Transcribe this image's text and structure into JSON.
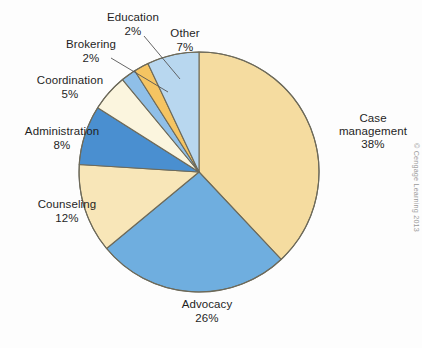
{
  "figure": {
    "background_color": "#fdfdfd",
    "credit": "© Cengage Learning 2013"
  },
  "chart_data": {
    "type": "pie",
    "title": "",
    "subtitle": "",
    "xlabel": "",
    "ylabel": "",
    "legend_position": "none",
    "grid": false,
    "units": "percent",
    "total": 100,
    "start_angle_deg": 0,
    "direction": "clockwise",
    "categories": [
      "Case management",
      "Advocacy",
      "Counseling",
      "Administration",
      "Coordination",
      "Brokering",
      "Education",
      "Other"
    ],
    "values": [
      38,
      26,
      12,
      8,
      5,
      2,
      2,
      7
    ],
    "colors": [
      "#f5dca0",
      "#6faedf",
      "#f8e6b8",
      "#4a8fd0",
      "#fbf5de",
      "#8fbfe8",
      "#f5c462",
      "#b8d7ef"
    ],
    "slices": [
      {
        "label": "Case management",
        "label_line1": "Case",
        "label_line2": "management",
        "value": 38,
        "value_text": "38%",
        "color": "#f5dca0",
        "leader_line": false
      },
      {
        "label": "Advocacy",
        "label_line1": "Advocacy",
        "label_line2": "",
        "value": 26,
        "value_text": "26%",
        "color": "#6faedf",
        "leader_line": false
      },
      {
        "label": "Counseling",
        "label_line1": "Counseling",
        "label_line2": "",
        "value": 12,
        "value_text": "12%",
        "color": "#f8e6b8",
        "leader_line": false
      },
      {
        "label": "Administration",
        "label_line1": "Administration",
        "label_line2": "",
        "value": 8,
        "value_text": "8%",
        "color": "#4a8fd0",
        "leader_line": false
      },
      {
        "label": "Coordination",
        "label_line1": "Coordination",
        "label_line2": "",
        "value": 5,
        "value_text": "5%",
        "color": "#fbf5de",
        "leader_line": false
      },
      {
        "label": "Brokering",
        "label_line1": "Brokering",
        "label_line2": "",
        "value": 2,
        "value_text": "2%",
        "color": "#8fbfe8",
        "leader_line": true
      },
      {
        "label": "Education",
        "label_line1": "Education",
        "label_line2": "",
        "value": 2,
        "value_text": "2%",
        "color": "#f5c462",
        "leader_line": true
      },
      {
        "label": "Other",
        "label_line1": "Other",
        "label_line2": "",
        "value": 7,
        "value_text": "7%",
        "color": "#b8d7ef",
        "leader_line": false
      }
    ],
    "outline_color": "#6d6a5a",
    "outline_width": 1.1
  },
  "labels": {
    "education": {
      "name": "Education",
      "pct": "2%"
    },
    "other": {
      "name": "Other",
      "pct": "7%"
    },
    "brokering": {
      "name": "Brokering",
      "pct": "2%"
    },
    "coordination": {
      "name": "Coordination",
      "pct": "5%"
    },
    "administration": {
      "name": "Administration",
      "pct": "8%"
    },
    "counseling": {
      "name": "Counseling",
      "pct": "12%"
    },
    "advocacy": {
      "name": "Advocacy",
      "pct": "26%"
    },
    "case_management": {
      "name_line1": "Case",
      "name_line2": "management",
      "pct": "38%"
    }
  }
}
